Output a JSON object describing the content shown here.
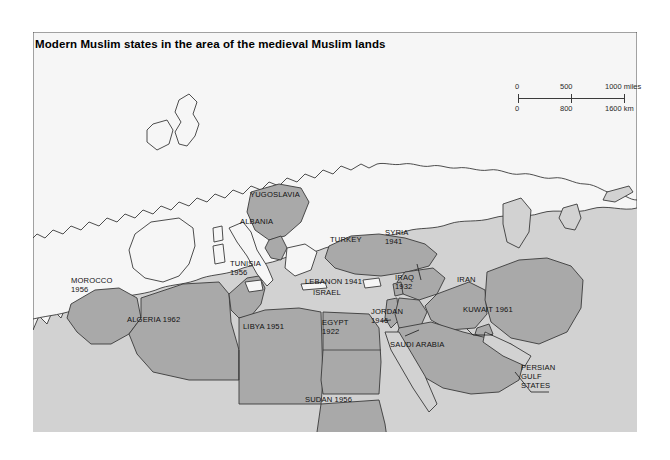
{
  "title": "Modern Muslim states in the area of the medieval Muslim lands",
  "colors": {
    "ocean": "#d2d2d2",
    "land_other": "#f6f6f6",
    "muslim_state": "#a9a9a9",
    "border": "#3a3a3a",
    "text": "#111111",
    "page_background": "#ffffff"
  },
  "scale_bar": {
    "miles": {
      "start": "0",
      "mid": "500",
      "end": "1000 miles"
    },
    "km": {
      "start": "0",
      "mid": "800",
      "end": "1600 km"
    }
  },
  "map": {
    "type": "choropleth-historical",
    "projection": "regional — western Europe, North Africa, Middle East, Central Asia",
    "legend_note": "Darker grey fill marks modern Muslim states; dates are years of independence.",
    "labels": [
      {
        "name": "yugoslavia",
        "text": "YUGOSLAVIA",
        "x": 250,
        "y": 190
      },
      {
        "name": "albania",
        "text": "ALBANIA",
        "x": 240,
        "y": 217
      },
      {
        "name": "turkey",
        "text": "TURKEY",
        "x": 330,
        "y": 235
      },
      {
        "name": "syria",
        "text": "SYRIA\n1941",
        "x": 385,
        "y": 228
      },
      {
        "name": "iran",
        "text": "IRAN",
        "x": 457,
        "y": 275
      },
      {
        "name": "iraq",
        "text": "IRAQ\n1932",
        "x": 395,
        "y": 273
      },
      {
        "name": "kuwait",
        "text": "KUWAIT 1961",
        "x": 463,
        "y": 305
      },
      {
        "name": "lebanon",
        "text": "LEBANON 1941",
        "x": 305,
        "y": 277
      },
      {
        "name": "israel",
        "text": "ISRAEL",
        "x": 313,
        "y": 288
      },
      {
        "name": "jordan",
        "text": "JORDAN\n1946",
        "x": 371,
        "y": 307
      },
      {
        "name": "saudi-arabia",
        "text": "SAUDI ARABIA",
        "x": 390,
        "y": 340
      },
      {
        "name": "persian-gulf-states",
        "text": "PERSIAN\nGULF\nSTATES",
        "x": 521,
        "y": 363
      },
      {
        "name": "egypt",
        "text": "EGYPT\n1922",
        "x": 322,
        "y": 318
      },
      {
        "name": "sudan",
        "text": "SUDAN 1956",
        "x": 305,
        "y": 395
      },
      {
        "name": "libya",
        "text": "LIBYA 1951",
        "x": 243,
        "y": 322
      },
      {
        "name": "tunisia",
        "text": "TUNISIA\n1956",
        "x": 230,
        "y": 259
      },
      {
        "name": "algeria",
        "text": "ALGERIA 1962",
        "x": 127,
        "y": 315
      },
      {
        "name": "morocco",
        "text": "MOROCCO\n1956",
        "x": 71,
        "y": 276
      }
    ]
  }
}
